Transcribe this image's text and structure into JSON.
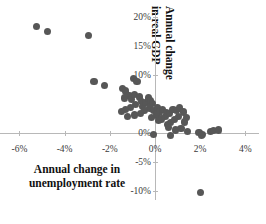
{
  "chart_data": {
    "type": "scatter",
    "title": "",
    "xlabel": "Annual change in unemployment rate",
    "ylabel": "Annual change in real GDP",
    "ylabel_line1": "Annual change",
    "ylabel_line2": "in real GDP",
    "xlabel_line1": "Annual change in",
    "xlabel_line2": "unemployment rate",
    "xlim": [
      -7.0,
      4.6
    ],
    "ylim": [
      -11.5,
      21.0
    ],
    "xticks": [
      -6,
      -4,
      -2,
      0,
      2,
      4
    ],
    "xtick_labels": [
      "-6%",
      "-4%",
      "-2%",
      "0%",
      "2%",
      "4%"
    ],
    "yticks": [
      20,
      15,
      10,
      5,
      0,
      -5,
      -10
    ],
    "ytick_labels": [
      "20%",
      "15%",
      "10%",
      "5%",
      "0%",
      "-5%",
      "-10%"
    ],
    "grid": false,
    "legend": null,
    "marker_color": "#575757",
    "axis_color": "#b8b8b8",
    "series": [
      {
        "name": "Countries",
        "points": [
          [
            -5.25,
            18.3
          ],
          [
            -4.75,
            17.4
          ],
          [
            -2.95,
            16.7
          ],
          [
            -2.7,
            8.9
          ],
          [
            -2.25,
            8.1
          ],
          [
            -1.45,
            7.7
          ],
          [
            -1.3,
            7.2
          ],
          [
            -0.95,
            9.3
          ],
          [
            -0.8,
            8.9
          ],
          [
            -1.15,
            6.4
          ],
          [
            -1.35,
            6.0
          ],
          [
            -1.05,
            5.8
          ],
          [
            -0.9,
            6.6
          ],
          [
            -0.7,
            6.2
          ],
          [
            -0.6,
            5.4
          ],
          [
            -0.85,
            4.9
          ],
          [
            -1.1,
            4.4
          ],
          [
            -1.3,
            4.0
          ],
          [
            -1.5,
            3.7
          ],
          [
            -0.55,
            4.6
          ],
          [
            -0.4,
            5.2
          ],
          [
            -0.3,
            6.0
          ],
          [
            -0.2,
            5.6
          ],
          [
            -0.1,
            5.0
          ],
          [
            -0.25,
            4.3
          ],
          [
            -0.45,
            3.9
          ],
          [
            -0.65,
            3.4
          ],
          [
            -0.9,
            3.1
          ],
          [
            -1.2,
            2.8
          ],
          [
            -0.05,
            3.8
          ],
          [
            0.1,
            4.4
          ],
          [
            0.2,
            3.6
          ],
          [
            0.05,
            3.1
          ],
          [
            -0.15,
            2.7
          ],
          [
            0.35,
            4.0
          ],
          [
            0.5,
            3.5
          ],
          [
            0.45,
            2.9
          ],
          [
            0.3,
            2.4
          ],
          [
            0.15,
            2.1
          ],
          [
            0.65,
            3.3
          ],
          [
            0.8,
            4.1
          ],
          [
            0.95,
            3.8
          ],
          [
            1.1,
            4.3
          ],
          [
            1.25,
            3.6
          ],
          [
            1.05,
            2.9
          ],
          [
            0.85,
            2.3
          ],
          [
            0.7,
            1.8
          ],
          [
            0.55,
            1.4
          ],
          [
            1.4,
            2.6
          ],
          [
            1.3,
            1.9
          ],
          [
            0.6,
            0.9
          ],
          [
            0.9,
            0.5
          ],
          [
            1.15,
            0.8
          ],
          [
            -0.05,
            -0.3
          ],
          [
            0.7,
            -0.5
          ],
          [
            1.45,
            0.2
          ],
          [
            1.95,
            0.1
          ],
          [
            2.1,
            -0.2
          ],
          [
            2.45,
            0.3
          ],
          [
            2.6,
            0.4
          ],
          [
            2.8,
            0.5
          ],
          [
            2.05,
            -0.5
          ],
          [
            2.0,
            -10.2
          ]
        ]
      }
    ]
  }
}
